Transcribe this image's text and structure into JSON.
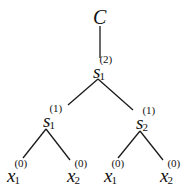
{
  "diagram": {
    "type": "tree",
    "root": {
      "id": "root",
      "label": "C"
    },
    "nodes": [
      {
        "id": "s12",
        "base": "s",
        "sub": "1",
        "sup": "(2)"
      },
      {
        "id": "s11",
        "base": "s",
        "sub": "1",
        "sup": "(1)"
      },
      {
        "id": "s21",
        "base": "s",
        "sub": "2",
        "sup": "(1)"
      },
      {
        "id": "leaf1",
        "base": "x",
        "sub": "1",
        "sup": "(0)"
      },
      {
        "id": "leaf2",
        "base": "x",
        "sub": "2",
        "sup": "(0)"
      },
      {
        "id": "leaf3",
        "base": "x",
        "sub": "1",
        "sup": "(0)"
      },
      {
        "id": "leaf4",
        "base": "x",
        "sub": "2",
        "sup": "(0)"
      }
    ],
    "edges": [
      [
        "root",
        "s12"
      ],
      [
        "s12",
        "s11"
      ],
      [
        "s12",
        "s21"
      ],
      [
        "s11",
        "leaf1"
      ],
      [
        "s11",
        "leaf2"
      ],
      [
        "s21",
        "leaf3"
      ],
      [
        "s21",
        "leaf4"
      ]
    ],
    "line_color": "#1a1a1a",
    "text_color": "#111111"
  }
}
